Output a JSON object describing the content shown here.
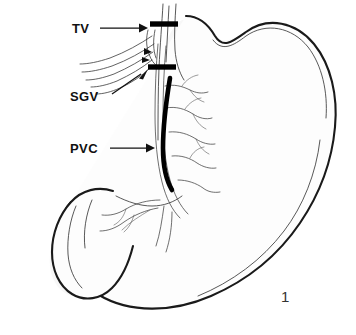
{
  "figure": {
    "number": "1",
    "background_color": "#ffffff",
    "ink_color": "#111111",
    "marker_color": "#000000",
    "vessel_color": "#4a4a4a"
  },
  "labels": [
    {
      "id": "tv",
      "text": "TV",
      "meaning": "truncal vagotomy",
      "text_x": 72,
      "text_y": 33,
      "leader_type": "horizontal-arrow",
      "leader_x1": 100,
      "leader_y1": 28,
      "leader_x2": 143,
      "leader_y2": 28
    },
    {
      "id": "sgv",
      "text": "SGV",
      "meaning": "short gastric vessels",
      "text_x": 70,
      "text_y": 101,
      "leader_type": "diagonal-arrow",
      "leader_x1": 112,
      "leader_y1": 94,
      "leader_x2": 145,
      "leader_y2": 71
    },
    {
      "id": "pvc",
      "text": "PVC",
      "meaning": "posterior vagal nerve / criminal nerve",
      "text_x": 70,
      "text_y": 153,
      "leader_type": "horizontal-arrow",
      "leader_x1": 110,
      "leader_y1": 148,
      "leader_x2": 150,
      "leader_y2": 148
    }
  ],
  "markers": [
    {
      "id": "transection-bar-upper",
      "name": "esophageal transection marker",
      "x1": 150,
      "y1": 24,
      "x2": 178,
      "y2": 24
    },
    {
      "id": "transection-bar-lower",
      "name": "vagal trunk division marker",
      "x1": 148,
      "y1": 67,
      "x2": 176,
      "y2": 67
    }
  ],
  "structures": {
    "pvc_line_label": "thick black line along lesser curvature",
    "stomach_label": "stomach body and fundus",
    "duodenum_label": "duodenum and pylorus",
    "esophagus_label": "distal esophagus"
  }
}
